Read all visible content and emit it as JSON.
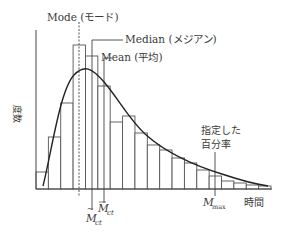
{
  "chart_data": {
    "type": "bar",
    "title": "",
    "xlabel": "時間",
    "ylabel": "度数",
    "grid": false,
    "legend": null,
    "categories": [
      "b1",
      "b2",
      "b3",
      "b4",
      "b5",
      "b6",
      "b7",
      "b8",
      "b9",
      "b10",
      "b11",
      "b12",
      "b13",
      "b14",
      "b15",
      "b16",
      "b17",
      "b18",
      "b19"
    ],
    "values": [
      17,
      52,
      86,
      144,
      133,
      103,
      67,
      73,
      56,
      44,
      39,
      31,
      26,
      19,
      13,
      8,
      6,
      4,
      3
    ],
    "bar_tops_px": [
      172,
      137,
      103,
      45,
      56,
      86,
      122,
      116,
      133,
      145,
      150,
      158,
      163,
      170,
      176,
      181,
      183,
      185,
      186
    ],
    "overlay": {
      "type": "line",
      "name": "fitted distribution curve",
      "shape": "right-skewed (log-normal-like)"
    },
    "annotations": [
      {
        "text": "Mode (モード)",
        "target": "mode line (dashed)"
      },
      {
        "text": "Median (メジアン)",
        "target": "median line"
      },
      {
        "text": "Mean (平均)",
        "target": "mean line"
      },
      {
        "text": "指定した",
        "target": "percentile line"
      },
      {
        "text": "百分率",
        "target": "percentile line"
      }
    ],
    "x_markers": [
      {
        "label": "M̃",
        "sub": "ct",
        "meaning": "median marker"
      },
      {
        "label": "M̄",
        "sub": "ct",
        "meaning": "mean marker"
      },
      {
        "label": "M",
        "sub": "max",
        "meaning": "specified percentile"
      }
    ]
  },
  "labels": {
    "mode": "Mode (モード)",
    "median": "Median (メジアン)",
    "mean": "Mean (平均)",
    "percentile_line1": "指定した",
    "percentile_line2": "百分率",
    "y_axis": "度数",
    "x_axis": "時間",
    "median_marker_main": "M",
    "median_marker_sub": "ct",
    "mean_marker_main": "M",
    "mean_marker_sub": "ct",
    "max_marker_main": "M",
    "max_marker_sub": "max"
  },
  "colors": {
    "line": "#333333",
    "bar_stroke": "#555555",
    "bar_fill": "#ffffff",
    "text": "#3a3a3a"
  }
}
